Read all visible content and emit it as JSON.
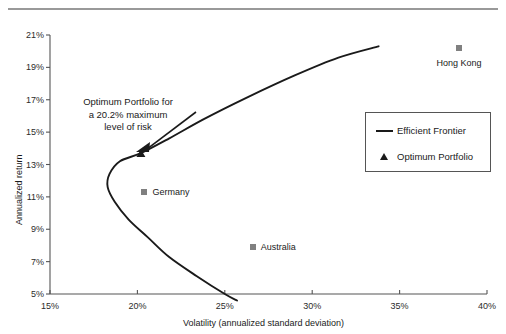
{
  "chart_data": {
    "type": "scatter",
    "title": "",
    "xlabel": "Volatility (annualized standard deviation)",
    "ylabel": "Annualized return",
    "xlim": [
      15,
      40
    ],
    "ylim": [
      5,
      21
    ],
    "xticks": [
      "15%",
      "20%",
      "25%",
      "30%",
      "35%",
      "40%"
    ],
    "xtick_values": [
      15,
      20,
      25,
      30,
      35,
      40
    ],
    "yticks": [
      "5%",
      "7%",
      "9%",
      "11%",
      "13%",
      "15%",
      "17%",
      "19%",
      "21%"
    ],
    "ytick_values": [
      5,
      7,
      9,
      11,
      13,
      15,
      17,
      19,
      21
    ],
    "grid": false,
    "legend_position": "right-middle",
    "series": [
      {
        "name": "Efficient Frontier",
        "type": "line",
        "marker": "line",
        "color": "#1a1a1a",
        "points": [
          {
            "x": 25.7,
            "y": 4.6
          },
          {
            "x": 25.0,
            "y": 5.0
          },
          {
            "x": 23.4,
            "y": 6.1
          },
          {
            "x": 21.8,
            "y": 7.3
          },
          {
            "x": 20.6,
            "y": 8.5
          },
          {
            "x": 19.5,
            "y": 9.6
          },
          {
            "x": 18.7,
            "y": 10.7
          },
          {
            "x": 18.3,
            "y": 11.6
          },
          {
            "x": 18.4,
            "y": 12.4
          },
          {
            "x": 19.0,
            "y": 13.2
          },
          {
            "x": 20.2,
            "y": 13.7
          },
          {
            "x": 21.8,
            "y": 14.6
          },
          {
            "x": 23.8,
            "y": 15.8
          },
          {
            "x": 26.2,
            "y": 17.1
          },
          {
            "x": 29.0,
            "y": 18.5
          },
          {
            "x": 31.5,
            "y": 19.6
          },
          {
            "x": 33.8,
            "y": 20.3
          }
        ]
      },
      {
        "name": "Optimum Portfolio",
        "type": "marker",
        "marker": "triangle",
        "color": "#1a1a1a",
        "points": [
          {
            "x": 20.2,
            "y": 13.7
          }
        ]
      },
      {
        "name": "Country indices",
        "type": "marker",
        "marker": "square",
        "color": "#808080",
        "points": [
          {
            "x": 38.4,
            "y": 20.2,
            "label": "Hong Kong",
            "label_pos": "below"
          },
          {
            "x": 20.4,
            "y": 11.3,
            "label": "Germany",
            "label_pos": "right"
          },
          {
            "x": 26.6,
            "y": 7.9,
            "label": "Australia",
            "label_pos": "right"
          }
        ]
      }
    ],
    "annotations": [
      {
        "name": "optimum-portfolio-callout",
        "text_lines": [
          "Optimum Portfolio for",
          "a 20.2% maximum",
          "level of risk"
        ],
        "text": "Optimum Portfolio for a 20.2% maximum level of risk",
        "points_to": {
          "x": 20.2,
          "y": 13.7
        }
      }
    ]
  },
  "legend": {
    "entries": [
      {
        "label": "Efficient Frontier",
        "key": "line-key",
        "color": "#1a1a1a"
      },
      {
        "label": "Optimum Portfolio",
        "key": "triangle-key",
        "color": "#1a1a1a"
      }
    ]
  },
  "colors": {
    "axis": "#555555",
    "line": "#1a1a1a",
    "marker_square": "#808080",
    "text": "#1a1a1a",
    "rule": "#777777",
    "background": "#ffffff"
  }
}
